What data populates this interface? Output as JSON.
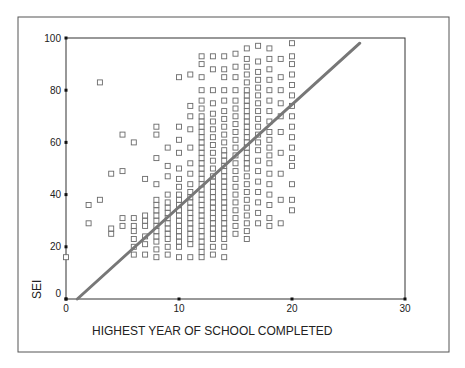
{
  "chart_data": {
    "type": "scatter",
    "title": "",
    "xlabel": "HIGHEST YEAR OF SCHOOL COMPLETED",
    "ylabel": "SEI",
    "xlim": [
      0,
      30
    ],
    "ylim": [
      0,
      100
    ],
    "x_ticks": [
      "0",
      "10",
      "20",
      "30"
    ],
    "y_ticks": [
      "0",
      "20",
      "40",
      "60",
      "80",
      "100"
    ],
    "grid": false,
    "legend": null,
    "marker": "hollow-square",
    "fit_line": {
      "type": "linear",
      "x0": 1,
      "y0": 0,
      "x1": 26,
      "y1": 98,
      "color": "#777777"
    },
    "columns": [
      {
        "x": 0,
        "sei": [
          16
        ]
      },
      {
        "x": 2,
        "sei": [
          29,
          36
        ]
      },
      {
        "x": 3,
        "sei": [
          38,
          83
        ]
      },
      {
        "x": 4,
        "sei": [
          25,
          27,
          48
        ]
      },
      {
        "x": 5,
        "sei": [
          28,
          31,
          49,
          63
        ]
      },
      {
        "x": 6,
        "sei": [
          17,
          20,
          23,
          26,
          28,
          31,
          60
        ]
      },
      {
        "x": 7,
        "sei": [
          17,
          21,
          24,
          28,
          30,
          32,
          46
        ]
      },
      {
        "x": 8,
        "sei": [
          16,
          19,
          22,
          24,
          26,
          28,
          30,
          32,
          34,
          36,
          38,
          44,
          54,
          63,
          66
        ]
      },
      {
        "x": 9,
        "sei": [
          17,
          20,
          23,
          25,
          27,
          29,
          31,
          33,
          35,
          37,
          40,
          47,
          51,
          58
        ]
      },
      {
        "x": 10,
        "sei": [
          16,
          20,
          22,
          24,
          26,
          28,
          30,
          32,
          34,
          36,
          38,
          40,
          43,
          46,
          50,
          56,
          61,
          66,
          85
        ]
      },
      {
        "x": 11,
        "sei": [
          16,
          21,
          23,
          25,
          27,
          29,
          31,
          33,
          35,
          37,
          39,
          41,
          44,
          48,
          52,
          58,
          65,
          70,
          74,
          86
        ]
      },
      {
        "x": 12,
        "sei": [
          16,
          18,
          20,
          22,
          24,
          26,
          28,
          30,
          32,
          34,
          36,
          38,
          40,
          42,
          44,
          46,
          48,
          50,
          52,
          54,
          56,
          58,
          60,
          62,
          64,
          66,
          68,
          70,
          73,
          76,
          80,
          85,
          90,
          93
        ]
      },
      {
        "x": 13,
        "sei": [
          17,
          20,
          23,
          25,
          27,
          29,
          31,
          33,
          35,
          37,
          39,
          41,
          43,
          45,
          47,
          50,
          53,
          56,
          59,
          62,
          65,
          68,
          71,
          75,
          80,
          88,
          93
        ]
      },
      {
        "x": 14,
        "sei": [
          16,
          20,
          23,
          25,
          27,
          29,
          31,
          33,
          35,
          37,
          39,
          41,
          43,
          45,
          47,
          49,
          51,
          53,
          55,
          57,
          60,
          63,
          66,
          69,
          72,
          76,
          80,
          85,
          88,
          93
        ]
      },
      {
        "x": 15,
        "sei": [
          25,
          28,
          31,
          34,
          37,
          40,
          43,
          46,
          49,
          52,
          55,
          58,
          61,
          64,
          67,
          70,
          73,
          76,
          80,
          85,
          89,
          94
        ]
      },
      {
        "x": 16,
        "sei": [
          23,
          26,
          29,
          32,
          35,
          38,
          41,
          44,
          47,
          50,
          52,
          54,
          56,
          58,
          60,
          62,
          64,
          66,
          68,
          70,
          72,
          74,
          76,
          78,
          80,
          83,
          86,
          89,
          92,
          96
        ]
      },
      {
        "x": 17,
        "sei": [
          29,
          33,
          37,
          41,
          45,
          49,
          53,
          57,
          60,
          63,
          66,
          69,
          72,
          75,
          78,
          81,
          84,
          87,
          91,
          97
        ]
      },
      {
        "x": 18,
        "sei": [
          28,
          31,
          36,
          40,
          44,
          48,
          52,
          55,
          58,
          61,
          64,
          68,
          72,
          76,
          80,
          84,
          88,
          92,
          96
        ]
      },
      {
        "x": 19,
        "sei": [
          29,
          38,
          48,
          56,
          64,
          70,
          75,
          80,
          85,
          92
        ]
      },
      {
        "x": 20,
        "sei": [
          34,
          38,
          44,
          51,
          54,
          58,
          62,
          66,
          70,
          74,
          78,
          82,
          86,
          90,
          93,
          98
        ]
      }
    ]
  },
  "axes": {
    "x_title": "HIGHEST YEAR OF SCHOOL COMPLETED",
    "y_title": "SEI",
    "x_ticks": [
      {
        "value": 0,
        "label": "0"
      },
      {
        "value": 10,
        "label": "10"
      },
      {
        "value": 20,
        "label": "20"
      },
      {
        "value": 30,
        "label": "30"
      }
    ],
    "y_ticks": [
      {
        "value": 0,
        "label": "0"
      },
      {
        "value": 20,
        "label": "20"
      },
      {
        "value": 40,
        "label": "40"
      },
      {
        "value": 60,
        "label": "60"
      },
      {
        "value": 80,
        "label": "80"
      },
      {
        "value": 100,
        "label": "100"
      }
    ]
  },
  "colors": {
    "frame": "#555555",
    "axis": "#222222",
    "marker": "#6a6a6a",
    "fit_line": "#777777"
  }
}
